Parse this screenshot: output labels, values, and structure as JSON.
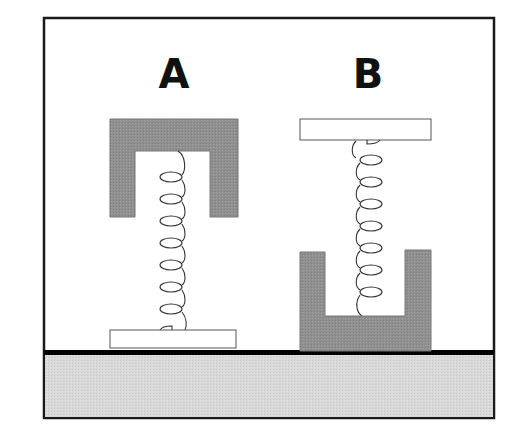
{
  "diagram": {
    "title": "",
    "labels": {
      "left": "A",
      "right": "B"
    },
    "colors": {
      "frame": "#1a1a1a",
      "block_fill": "#8f8f8f",
      "plate_fill": "#ffffff",
      "ground_fill": "#d6d6d6",
      "ground_line": "#000000",
      "spring": "#333333"
    },
    "setups": [
      {
        "id": "A",
        "top": "heavy inverted U-shaped block (gray)",
        "bottom": "light flat plate (white) resting on ground",
        "spring": "attached between block ceiling and plate"
      },
      {
        "id": "B",
        "top": "light flat plate (white)",
        "bottom": "heavy U-shaped block (gray) resting on ground",
        "spring": "attached between plate and block floor"
      }
    ]
  }
}
